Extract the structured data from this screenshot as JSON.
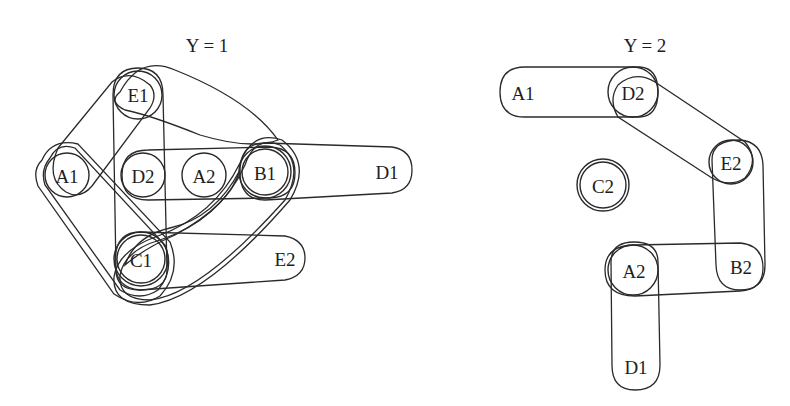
{
  "diagram_type": "hypergraph",
  "panels": [
    {
      "title": "Y = 1",
      "nodes": [
        {
          "id": "E1",
          "label": "E1"
        },
        {
          "id": "A1",
          "label": "A1"
        },
        {
          "id": "D2",
          "label": "D2"
        },
        {
          "id": "A2",
          "label": "A2"
        },
        {
          "id": "B1",
          "label": "B1"
        },
        {
          "id": "D1",
          "label": "D1"
        },
        {
          "id": "C1",
          "label": "C1"
        },
        {
          "id": "E2",
          "label": "E2"
        }
      ],
      "hyperedges": [
        [
          "A1",
          "E1"
        ],
        [
          "E1",
          "C1"
        ],
        [
          "E1",
          "B1"
        ],
        [
          "A1",
          "C1"
        ],
        [
          "D2",
          "A2",
          "B1"
        ],
        [
          "B1",
          "D1"
        ],
        [
          "C1",
          "E2"
        ],
        [
          "C1",
          "B1"
        ],
        [
          "C1",
          "A2"
        ],
        [
          "A1",
          "B1",
          "C1"
        ]
      ]
    },
    {
      "title": "Y = 2",
      "nodes": [
        {
          "id": "A1",
          "label": "A1"
        },
        {
          "id": "D2",
          "label": "D2"
        },
        {
          "id": "E2",
          "label": "E2"
        },
        {
          "id": "C2",
          "label": "C2"
        },
        {
          "id": "A2",
          "label": "A2"
        },
        {
          "id": "B2",
          "label": "B2"
        },
        {
          "id": "D1",
          "label": "D1"
        }
      ],
      "hyperedges": [
        [
          "A1",
          "D2"
        ],
        [
          "D2",
          "E2"
        ],
        [
          "E2",
          "B2"
        ],
        [
          "A2",
          "B2"
        ],
        [
          "A2",
          "D1"
        ],
        [
          "C2"
        ]
      ]
    }
  ]
}
